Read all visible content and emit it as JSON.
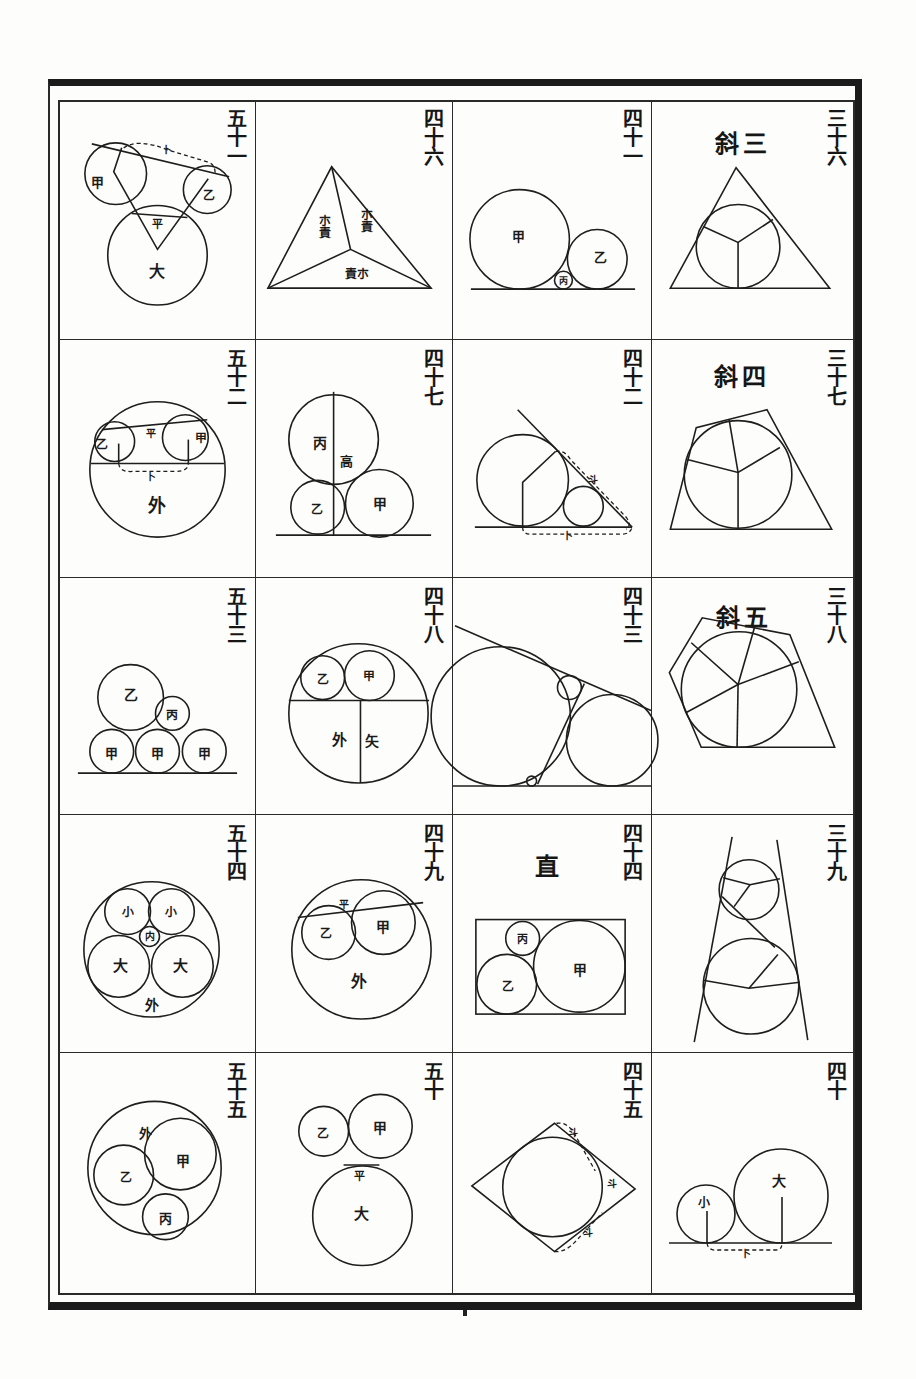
{
  "page": {
    "layout": {
      "columns": 4,
      "rows": 5,
      "reading_order": "right-to-left columns, top-to-bottom"
    }
  },
  "cells": {
    "r0c0": {
      "number": "五十一",
      "labels": {
        "a": "甲",
        "b": "乙",
        "big": "大",
        "top": "卜",
        "mid": "平"
      }
    },
    "r0c1": {
      "number": "四十六",
      "labels": {
        "left": "朩責",
        "right": "朩責",
        "bottom": "責朩"
      }
    },
    "r0c2": {
      "number": "四十一",
      "labels": {
        "a": "甲",
        "b": "乙",
        "c": "丙"
      }
    },
    "r0c3": {
      "number": "三十六",
      "heading": "斜三"
    },
    "r1c0": {
      "number": "五十二",
      "labels": {
        "a": "甲",
        "b": "乙",
        "outer": "外",
        "top": "平",
        "mid": "卜"
      }
    },
    "r1c1": {
      "number": "四十七",
      "labels": {
        "a": "甲",
        "b": "乙",
        "c": "丙",
        "height": "高"
      }
    },
    "r1c2": {
      "number": "四十二",
      "labels": {
        "slant": "斗",
        "base": "卜"
      }
    },
    "r1c3": {
      "number": "三十七",
      "heading": "斜四"
    },
    "r2c0": {
      "number": "五十三",
      "labels": {
        "a1": "甲",
        "a2": "甲",
        "a3": "甲",
        "b": "乙",
        "c": "丙"
      }
    },
    "r2c1": {
      "number": "四十八",
      "labels": {
        "a": "甲",
        "b": "乙",
        "outer": "外",
        "arrow": "矢"
      }
    },
    "r2c2": {
      "number": "四十三"
    },
    "r2c3": {
      "number": "三十八",
      "heading": "斜五"
    },
    "r3c0": {
      "number": "五十四",
      "labels": {
        "small1": "小",
        "small2": "小",
        "inner": "内",
        "big1": "大",
        "big2": "大",
        "outer": "外"
      }
    },
    "r3c1": {
      "number": "四十九",
      "labels": {
        "a": "甲",
        "b": "乙",
        "outer": "外",
        "top": "平"
      }
    },
    "r3c2": {
      "number": "四十四",
      "heading": "直",
      "labels": {
        "a": "甲",
        "b": "乙",
        "c": "丙"
      }
    },
    "r3c3": {
      "number": "三十九"
    },
    "r4c0": {
      "number": "五十五",
      "labels": {
        "a": "甲",
        "b": "乙",
        "c": "丙",
        "outer": "外"
      }
    },
    "r4c1": {
      "number": "五十",
      "labels": {
        "a": "甲",
        "b": "乙",
        "big": "大",
        "mid": "平"
      }
    },
    "r4c2": {
      "number": "四十五",
      "labels": {
        "top": "斗",
        "right": "斗",
        "bottom": "斗"
      }
    },
    "r4c3": {
      "number": "四十",
      "labels": {
        "small": "小",
        "big": "大",
        "base": "卜"
      }
    }
  },
  "colors": {
    "ink": "#1a1a1a",
    "paper": "#fdfdfb"
  }
}
